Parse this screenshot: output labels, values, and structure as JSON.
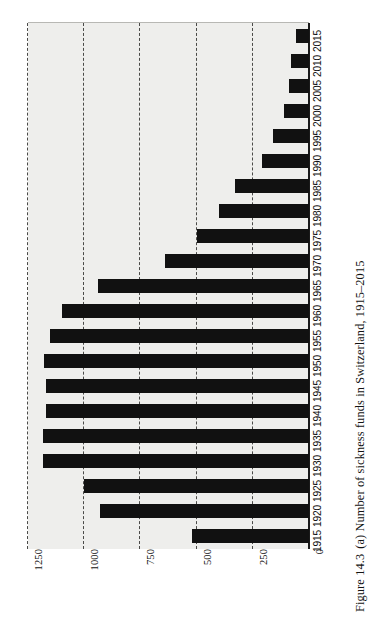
{
  "caption": {
    "figure_number": "Figure 14.3",
    "text": "(a) Number of sickness funds in Switzerland, 1915–2015",
    "full": "Figure 14.3  (a) Number of sickness funds in Switzerland, 1915–2015"
  },
  "colors": {
    "bar": "#111111",
    "panel_background": "#eeeeec",
    "gridline": "#4a4a48",
    "axis": "#1a1a1a",
    "page_background": "#ffffff"
  },
  "chart_data": {
    "type": "bar",
    "orientation": "horizontal",
    "title": "",
    "subtitle": "",
    "xlabel": "",
    "ylabel": "",
    "categories": [
      "1915",
      "1920",
      "1925",
      "1930",
      "1935",
      "1940",
      "1945",
      "1950",
      "1955",
      "1960",
      "1965",
      "1970",
      "1975",
      "1980",
      "1985",
      "1990",
      "1995",
      "2000",
      "2005",
      "2010",
      "2015"
    ],
    "values": [
      520,
      930,
      1000,
      1185,
      1185,
      1170,
      1170,
      1180,
      1150,
      1100,
      940,
      640,
      500,
      400,
      330,
      210,
      160,
      110,
      90,
      80,
      60
    ],
    "series": [
      {
        "name": "Number of sickness funds",
        "values": [
          520,
          930,
          1000,
          1185,
          1185,
          1170,
          1170,
          1180,
          1150,
          1100,
          940,
          640,
          500,
          400,
          330,
          210,
          160,
          110,
          90,
          80,
          60
        ]
      }
    ],
    "value_axis_ticks": [
      "1250",
      "1000",
      "750",
      "500",
      "250",
      "0"
    ],
    "value_axis_tick_values": [
      1250,
      1000,
      750,
      500,
      250,
      0
    ],
    "xlim": [
      0,
      1250
    ],
    "value_axis_max": 1250,
    "value_axis_min": 0,
    "grid": true,
    "grid_style": "dashed",
    "legend": false,
    "legend_position": "none",
    "rotation_note": "chart printed rotated 90 degrees on the page"
  }
}
